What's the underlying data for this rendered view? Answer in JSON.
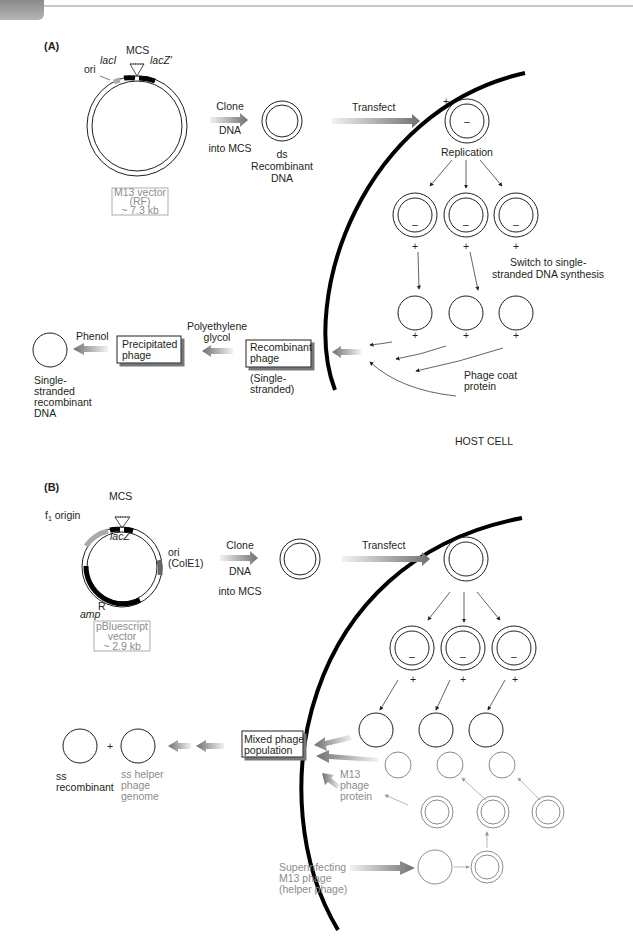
{
  "panelA": {
    "label": "(A)",
    "vector": {
      "mcs": "MCS",
      "lacI": "lacI",
      "lacZ": "lacZ'",
      "ori": "ori",
      "name_line1": "M13 vector",
      "name_line2": "(RF)",
      "name_line3": "~ 7.3 kb"
    },
    "clone": {
      "line1": "Clone",
      "line2": "DNA",
      "line3": "into MCS"
    },
    "ds_recombinant": {
      "line1": "ds",
      "line2": "Recombinant",
      "line3": "DNA"
    },
    "transfect": "Transfect",
    "replication": "Replication",
    "plus": "+",
    "minus": "–",
    "switch": {
      "line1": "Switch to single-",
      "line2": "stranded DNA synthesis"
    },
    "phage_coat": {
      "line1": "Phage coat",
      "line2": "protein"
    },
    "host_cell": "HOST CELL",
    "recombinant_phage": {
      "line1": "Recombinant",
      "line2": "phage",
      "note1": "(Single-",
      "note2": "stranded)"
    },
    "peg": {
      "line1": "Polyethylene",
      "line2": "glycol"
    },
    "precipitated_phage": {
      "line1": "Precipitated",
      "line2": "phage"
    },
    "phenol": "Phenol",
    "ss_dna": {
      "line1": "Single-",
      "line2": "stranded",
      "line3": "recombinant",
      "line4": "DNA"
    }
  },
  "panelB": {
    "label": "(B)",
    "vector": {
      "mcs": "MCS",
      "f1_origin": "f",
      "f1_sub": "1",
      "f1_rest": " origin",
      "lacZ": "lacZ",
      "ori": "ori",
      "colE1": "(ColE1)",
      "amp": "amp",
      "amp_sup": "R",
      "name_line1": "pBluescript",
      "name_line2": "vector",
      "name_line3": "~ 2.9 kb"
    },
    "clone": {
      "line1": "Clone",
      "line2": "DNA",
      "line3": "into MCS"
    },
    "transfect": "Transfect",
    "plus": "+",
    "minus": "–",
    "mixed_population": {
      "line1": "Mixed phage",
      "line2": "population"
    },
    "m13_protein": {
      "line1": "M13",
      "line2": "phage",
      "line3": "protein"
    },
    "superinfecting": {
      "line1": "Superinfecting",
      "line2": "M13 phage",
      "line3": "(helper phage)"
    },
    "ss_recombinant": {
      "line1": "ss",
      "line2": "recombinant"
    },
    "ss_helper": {
      "line1": "ss helper",
      "line2": "phage",
      "line3": "genome"
    },
    "plus_sign": "+"
  },
  "colors": {
    "text": "#231f20",
    "gray_text": "#8c8c8c",
    "arrow_dark": "#6e6e6e",
    "arrow_light": "#e8e8e8",
    "cell_wall": "#000000"
  }
}
